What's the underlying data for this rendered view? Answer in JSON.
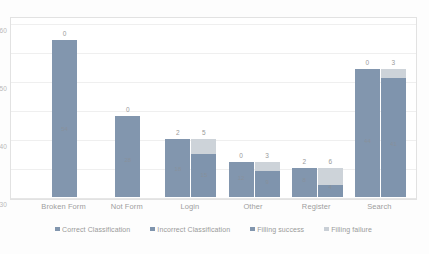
{
  "chart_data": {
    "type": "bar",
    "title": "",
    "subtitle": "",
    "xlabel": "",
    "ylabel": "",
    "ylim": [
      0,
      60
    ],
    "yticks": [
      0,
      10,
      20,
      30,
      40,
      50,
      60
    ],
    "grid": true,
    "legend_position": "bottom",
    "categories": [
      "Broken Form",
      "Not Form",
      "Login",
      "Other",
      "Register",
      "Search"
    ],
    "series": [
      {
        "name": "Correct Classification",
        "color": "#8296ae",
        "values": [
          54,
          28,
          15,
          9,
          4,
          41
        ]
      },
      {
        "name": "Incorrect Classification",
        "color": "#b7bfc9",
        "values": [
          0,
          0,
          2,
          0,
          2,
          0
        ]
      },
      {
        "name": "Filling success",
        "color": "#7f94ad",
        "values": [
          0,
          0,
          15,
          9,
          4,
          41
        ]
      },
      {
        "name": "Filling failure",
        "color": "#cdd3d9",
        "values": [
          0,
          0,
          5,
          3,
          6,
          3
        ]
      }
    ],
    "bars": [
      {
        "category": "Broken Form",
        "left_bar": {
          "total": 54,
          "base": 54,
          "top": 0,
          "top_label": "0",
          "inner_label": "54"
        },
        "right_bar": null
      },
      {
        "category": "Not Form",
        "left_bar": {
          "total": 28,
          "base": 28,
          "top": 0,
          "top_label": "0",
          "inner_label": "28"
        },
        "right_bar": null
      },
      {
        "category": "Login",
        "left_bar": {
          "total": 20,
          "base": 20,
          "top": 0,
          "top_label": "2",
          "inner_label": "18"
        },
        "right_bar": {
          "total": 20,
          "base": 15,
          "top": 5,
          "top_label": "5",
          "inner_label": "15"
        }
      },
      {
        "category": "Other",
        "left_bar": {
          "total": 12,
          "base": 12,
          "top": 0,
          "top_label": "0",
          "inner_label": "12"
        },
        "right_bar": {
          "total": 12,
          "base": 9,
          "top": 3,
          "top_label": "3",
          "inner_label": "9"
        }
      },
      {
        "category": "Register",
        "left_bar": {
          "total": 10,
          "base": 10,
          "top": 0,
          "top_label": "2",
          "inner_label": "8"
        },
        "right_bar": {
          "total": 10,
          "base": 4,
          "top": 6,
          "top_label": "6",
          "inner_label": "4"
        }
      },
      {
        "category": "Search",
        "left_bar": {
          "total": 44,
          "base": 44,
          "top": 0,
          "top_label": "0",
          "inner_label": "44"
        },
        "right_bar": {
          "total": 44,
          "base": 41,
          "top": 3,
          "top_label": "3",
          "inner_label": "41"
        }
      }
    ]
  },
  "legend": {
    "items": [
      {
        "label": "Correct Classification",
        "color": "#8296ae"
      },
      {
        "label": "Incorrect Classification",
        "color": "#7f94ad"
      },
      {
        "label": "Filling success",
        "color": "#8296ae"
      },
      {
        "label": "Filling failure",
        "color": "#c9cfd6"
      }
    ]
  },
  "colors": {
    "bar_primary": "#8296ae",
    "bar_secondary": "#7f94ad",
    "bar_light": "#cdd3d9",
    "gridline": "#efefef",
    "frame": "#e2e2e2",
    "axis_text": "#b9b9b9",
    "label_text": "#9d9d9d",
    "background": "#ffffff"
  }
}
